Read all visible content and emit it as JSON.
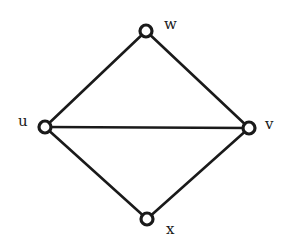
{
  "diagram": {
    "type": "graph",
    "nodes": [
      {
        "id": "w",
        "label": "w",
        "x": 146,
        "y": 31,
        "label_x": 164,
        "label_y": 29
      },
      {
        "id": "u",
        "label": "u",
        "x": 45,
        "y": 127,
        "label_x": 18,
        "label_y": 126
      },
      {
        "id": "v",
        "label": "v",
        "x": 249,
        "y": 128,
        "label_x": 265,
        "label_y": 129
      },
      {
        "id": "x",
        "label": "x",
        "x": 147,
        "y": 219,
        "label_x": 166,
        "label_y": 234
      }
    ],
    "edges": [
      {
        "from": "u",
        "to": "w"
      },
      {
        "from": "w",
        "to": "v"
      },
      {
        "from": "u",
        "to": "v"
      },
      {
        "from": "u",
        "to": "x"
      },
      {
        "from": "x",
        "to": "v"
      }
    ]
  }
}
